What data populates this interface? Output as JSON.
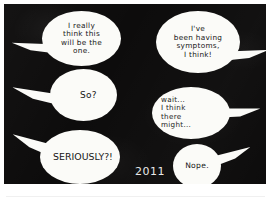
{
  "panel": {
    "background_color": "#0d0c0c",
    "balloon_color": "#fbfbf8",
    "ink_color": "#141414",
    "caption_color": "#e8e8e8",
    "year_caption": "2011"
  },
  "balloons": [
    {
      "id": "balloon-1",
      "speaker_side": "left",
      "tail_direction": "left",
      "text": "I really\nthink this\nwill be the\none."
    },
    {
      "id": "balloon-2",
      "speaker_side": "right",
      "tail_direction": "right",
      "text": "I've\nbeen having\nsymptoms,\nI think!"
    },
    {
      "id": "balloon-3",
      "speaker_side": "left",
      "tail_direction": "left",
      "text": "So?"
    },
    {
      "id": "balloon-4",
      "speaker_side": "right",
      "tail_direction": "right",
      "text": "wait...\nI think\nthere\n  might..."
    },
    {
      "id": "balloon-5",
      "speaker_side": "left",
      "tail_direction": "left",
      "text": "SERIOUSLY?!"
    },
    {
      "id": "balloon-6",
      "speaker_side": "right",
      "tail_direction": "right",
      "text": "Nope."
    }
  ]
}
